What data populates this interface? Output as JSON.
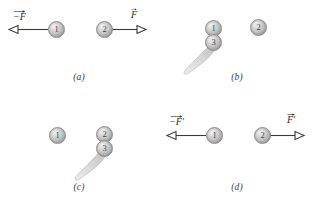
{
  "figure": {
    "background_color": "#ffffff",
    "ball_color": "#c2c2c2",
    "line_color": "#3a3a3a",
    "panels": [
      {
        "id": "a",
        "caption": "(a)",
        "balls": [
          {
            "label": "1",
            "x": 56,
            "y": 29
          },
          {
            "label": "2",
            "x": 104,
            "y": 29
          }
        ],
        "arrows": [
          {
            "name": "force-left",
            "label": "−F",
            "prime": "",
            "direction": "left",
            "label_x": 13,
            "label_y": 10
          },
          {
            "name": "force-right",
            "label": "F",
            "prime": "",
            "direction": "right",
            "label_x": 131,
            "label_y": 8
          }
        ]
      },
      {
        "id": "b",
        "caption": "(b)",
        "balls": [
          {
            "label": "1",
            "x": 55,
            "y": 28
          },
          {
            "label": "3",
            "x": 55,
            "y": 42
          },
          {
            "label": "2",
            "x": 100,
            "y": 27
          }
        ],
        "tail": {
          "from_x": 55,
          "from_y": 44,
          "to_x": 30,
          "to_y": 73
        }
      },
      {
        "id": "c",
        "caption": "(c)",
        "balls": [
          {
            "label": "1",
            "x": 57,
            "y": 29
          },
          {
            "label": "2",
            "x": 104,
            "y": 28
          },
          {
            "label": "3",
            "x": 104,
            "y": 42
          }
        ],
        "tail": {
          "from_x": 104,
          "from_y": 44,
          "to_x": 79,
          "to_y": 73
        }
      },
      {
        "id": "d",
        "caption": "(d)",
        "balls": [
          {
            "label": "1",
            "x": 56,
            "y": 29
          },
          {
            "label": "2",
            "x": 104,
            "y": 29
          }
        ],
        "arrows": [
          {
            "name": "force-left",
            "label": "−F",
            "prime": "′",
            "direction": "left",
            "label_x": 11,
            "label_y": 9
          },
          {
            "name": "force-right",
            "label": "F",
            "prime": "′",
            "direction": "right",
            "label_x": 129,
            "label_y": 7
          }
        ]
      }
    ]
  }
}
